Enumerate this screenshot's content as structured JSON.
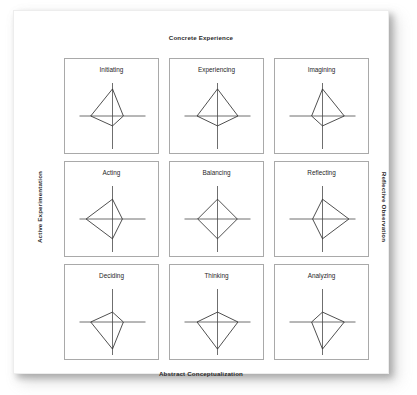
{
  "figure": {
    "title_top": "Concrete Experience",
    "title_bottom": "Abstract Conceptualization",
    "title_left": "Active Experimentation",
    "title_right": "Reflective Observation",
    "line_color": "#303030",
    "axis_color": "#4a4a4a",
    "cell_border_color": "#a9a9a9",
    "background_color": "#ffffff"
  },
  "chart_data": {
    "type": "line",
    "xlabel": "Active Experimentation — Reflective Observation",
    "ylabel": "Concrete Experience — Abstract Conceptualization",
    "grid": false,
    "legend": "none",
    "axes": [
      "Concrete Experience",
      "Reflective Observation",
      "Abstract Conceptualization",
      "Active Experimentation"
    ],
    "axis_max": 1.0,
    "axis_half_length_px": 33,
    "note": "Each small panel is a 4-spoke kite (radar) plot. Values are fractions of the full spoke length, ordered [up = Concrete Experience, right = Reflective Observation, down = Abstract Conceptualization, left = Active Experimentation].",
    "series": [
      {
        "name": "Initiating",
        "row": 0,
        "col": 0,
        "values": [
          0.82,
          0.33,
          0.3,
          0.66
        ]
      },
      {
        "name": "Experiencing",
        "row": 0,
        "col": 1,
        "values": [
          0.82,
          0.62,
          0.3,
          0.62
        ]
      },
      {
        "name": "Imagining",
        "row": 0,
        "col": 2,
        "values": [
          0.82,
          0.66,
          0.3,
          0.33
        ]
      },
      {
        "name": "Acting",
        "row": 1,
        "col": 0,
        "values": [
          0.6,
          0.3,
          0.6,
          0.8
        ]
      },
      {
        "name": "Balancing",
        "row": 1,
        "col": 1,
        "values": [
          0.6,
          0.6,
          0.6,
          0.6
        ]
      },
      {
        "name": "Reflecting",
        "row": 1,
        "col": 2,
        "values": [
          0.6,
          0.8,
          0.6,
          0.3
        ]
      },
      {
        "name": "Deciding",
        "row": 2,
        "col": 0,
        "values": [
          0.3,
          0.33,
          0.82,
          0.66
        ]
      },
      {
        "name": "Thinking",
        "row": 2,
        "col": 1,
        "values": [
          0.3,
          0.62,
          0.82,
          0.62
        ]
      },
      {
        "name": "Analyzing",
        "row": 2,
        "col": 2,
        "values": [
          0.3,
          0.66,
          0.82,
          0.33
        ]
      }
    ]
  }
}
